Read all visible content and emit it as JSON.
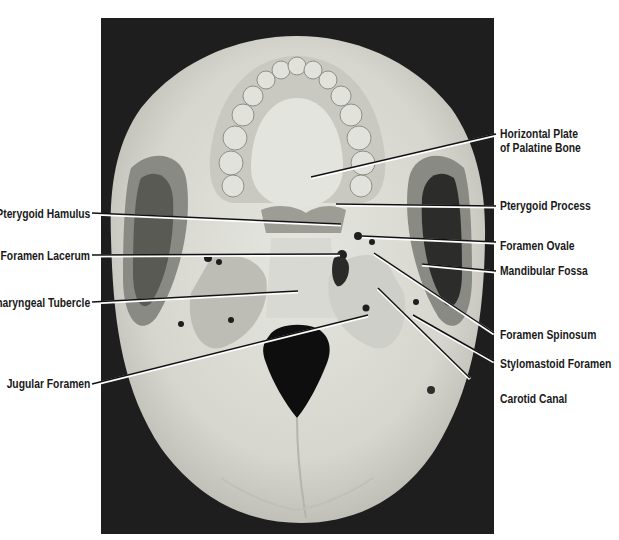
{
  "figure": {
    "background_color": "#1e1e1e",
    "bone_color": "#dcdcd6"
  },
  "labels": {
    "left": [
      {
        "id": "pterygoid-hamulus",
        "text": "Pterygoid Hamulus"
      },
      {
        "id": "foramen-lacerum",
        "text": "Foramen Lacerum"
      },
      {
        "id": "pharyngeal-tubercle",
        "text": "Pharyngeal Tubercle"
      },
      {
        "id": "jugular-foramen",
        "text": "Jugular Foramen"
      }
    ],
    "right": [
      {
        "id": "horizontal-plate",
        "text_line1": "Horizontal Plate",
        "text_line2": "of Palatine Bone"
      },
      {
        "id": "pterygoid-process",
        "text": "Pterygoid Process"
      },
      {
        "id": "foramen-ovale",
        "text": "Foramen Ovale"
      },
      {
        "id": "mandibular-fossa",
        "text": "Mandibular Fossa"
      },
      {
        "id": "foramen-spinosum",
        "text": "Foramen Spinosum"
      },
      {
        "id": "stylomastoid-foramen",
        "text": "Stylomastoid Foramen"
      },
      {
        "id": "carotid-canal",
        "text": "Carotid Canal"
      }
    ]
  }
}
